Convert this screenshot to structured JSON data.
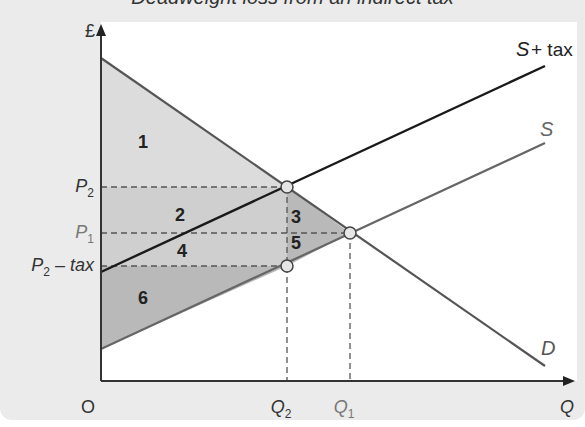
{
  "title": "Deadweight loss from an indirect tax",
  "chart_data": {
    "type": "line",
    "title": "Deadweight loss from an indirect tax",
    "xlabel": "Q",
    "ylabel": "£",
    "origin_label": "O",
    "x_ticks": [
      {
        "label": "Q",
        "sub": "2",
        "x": 287,
        "color": "#333333"
      },
      {
        "label": "Q",
        "sub": "1",
        "x": 350,
        "color": "#777777"
      }
    ],
    "y_ticks": [
      {
        "label": "P",
        "sub": "2",
        "suffix": "",
        "y": 187,
        "color": "#333333"
      },
      {
        "label": "P",
        "sub": "1",
        "suffix": "",
        "y": 233,
        "color": "#777777"
      },
      {
        "label": "P",
        "sub": "2",
        "suffix": " – tax",
        "y": 266,
        "color": "#333333"
      }
    ],
    "series": [
      {
        "name": "D",
        "label": "D",
        "from": [
          101,
          58
        ],
        "to": [
          545,
          366
        ],
        "color": "#555555"
      },
      {
        "name": "S",
        "label": "S",
        "from": [
          101,
          349
        ],
        "to": [
          545,
          143
        ],
        "color": "#666666"
      },
      {
        "name": "S + tax",
        "label": "S + tax",
        "from": [
          101,
          272
        ],
        "to": [
          545,
          66
        ],
        "color": "#1a1a1a"
      }
    ],
    "regions": [
      {
        "id": "1",
        "label": "1",
        "desc": "consumer surplus after tax",
        "fill": "#dcdcdc"
      },
      {
        "id": "2",
        "label": "2",
        "desc": "tax revenue from consumer surplus",
        "fill": "#cfcfcf"
      },
      {
        "id": "3",
        "label": "3",
        "desc": "deadweight loss (consumer)",
        "fill": "#b9b9b9"
      },
      {
        "id": "4",
        "label": "4",
        "desc": "tax revenue from producer surplus",
        "fill": "#cfcfcf"
      },
      {
        "id": "5",
        "label": "5",
        "desc": "deadweight loss (producer)",
        "fill": "#b9b9b9"
      },
      {
        "id": "6",
        "label": "6",
        "desc": "producer surplus after tax",
        "fill": "#b9b9b9"
      }
    ],
    "points": [
      {
        "name": "tax-equilibrium-consumer",
        "x": 287,
        "y": 187
      },
      {
        "name": "original-equilibrium",
        "x": 350,
        "y": 233
      },
      {
        "name": "tax-equilibrium-producer",
        "x": 287,
        "y": 266
      }
    ],
    "grid": false,
    "legend": "inline labels"
  }
}
